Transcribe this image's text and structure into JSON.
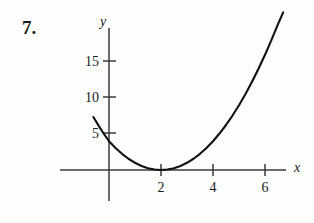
{
  "exercise": {
    "number_label": "7."
  },
  "figure": {
    "axis_labels": {
      "x": "x",
      "y": "y"
    },
    "colors": {
      "ink": "#1a1a1a",
      "axis": "#3a3a3a",
      "curve": "#111111",
      "background": "#fdfdfc"
    }
  },
  "chart_data": {
    "type": "line",
    "title": "",
    "subtitle": "",
    "xlabel": "x",
    "ylabel": "y",
    "grid": false,
    "legend": null,
    "annotations": [],
    "xlim": [
      -2,
      7
    ],
    "ylim": [
      -3,
      19
    ],
    "xticks": [
      2,
      4,
      6
    ],
    "xtick_labels": [
      "2",
      "4",
      "6"
    ],
    "yticks": [
      5,
      10,
      15
    ],
    "ytick_labels": [
      "5",
      "10",
      "15"
    ],
    "series": [
      {
        "name": "parabola",
        "equation": "y = x^2 - 5x + 4",
        "roots": [
          1,
          4
        ],
        "y_intercept": 4,
        "vertex": [
          2.5,
          -2.25
        ],
        "x": [
          -0.6,
          -0.4,
          -0.2,
          0,
          0.25,
          0.5,
          0.75,
          1,
          1.25,
          1.5,
          1.75,
          2,
          2.25,
          2.5,
          2.75,
          3,
          3.25,
          3.5,
          3.75,
          4,
          4.25,
          4.5,
          4.75,
          5,
          5.25,
          5.5,
          5.75,
          6,
          6.25,
          6.5,
          6.7
        ],
        "y": [
          7.36,
          6.16,
          5.04,
          4,
          3.0625,
          2.25,
          1.5625,
          1,
          0.5625,
          0.25,
          0.0625,
          0,
          0.0625,
          0.25,
          0.5625,
          1,
          1.5625,
          2.25,
          3.0625,
          4,
          5.0625,
          6.25,
          7.5625,
          9,
          10.5625,
          12.25,
          14.0625,
          16,
          18.0625,
          20.25,
          21.89
        ]
      }
    ]
  }
}
